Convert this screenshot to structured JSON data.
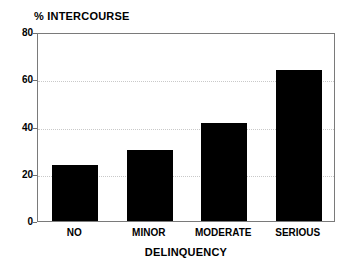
{
  "chart_data": {
    "type": "bar",
    "title": "",
    "categories": [
      "NO",
      "MINOR",
      "MODERATE",
      "SERIOUS"
    ],
    "values": [
      23.5,
      30,
      41.5,
      64
    ],
    "series": [
      {
        "name": "% INTERCOURSE",
        "values": [
          23.5,
          30,
          41.5,
          64
        ]
      }
    ],
    "xlabel": "DELINQUENCY",
    "ylabel": "% INTERCOURSE",
    "ylim": [
      0,
      80
    ],
    "yticks": [
      0,
      20,
      40,
      60,
      80
    ],
    "ytick_labels": [
      "0",
      "20",
      "40",
      "60",
      "80"
    ],
    "grid": true,
    "grid_axis": "y",
    "legend": false,
    "bar_color": "#000000",
    "grid_color": "#c9c9c9",
    "frame_color": "#7a7a7a",
    "background_color": "#ffffff"
  }
}
